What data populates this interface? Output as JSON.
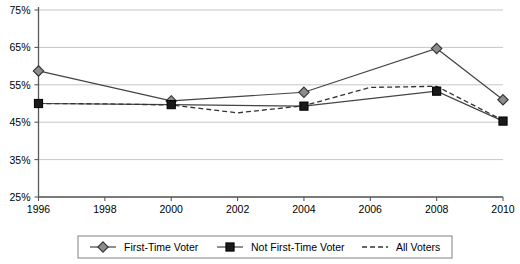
{
  "chart_data": {
    "type": "line",
    "title": "",
    "subtitle": "",
    "xlabel": "",
    "ylabel": "",
    "x": [
      1996,
      1998,
      2000,
      2002,
      2004,
      2006,
      2008,
      2010
    ],
    "xtick_labels": [
      "1996",
      "1998",
      "2000",
      "2002",
      "2004",
      "2006",
      "2008",
      "2010"
    ],
    "ytick_labels": [
      "25%",
      "35%",
      "45%",
      "55%",
      "65%",
      "75%"
    ],
    "ytick_values": [
      25,
      35,
      45,
      55,
      65,
      75
    ],
    "ylim": [
      25,
      75
    ],
    "xlim": [
      1996,
      2010
    ],
    "grid": true,
    "legend_position": "bottom",
    "series": [
      {
        "name": "First-Time Voter",
        "marker": "diamond",
        "linestyle": "solid",
        "color": "#8c8c8c",
        "x": [
          1996,
          2000,
          2004,
          2008,
          2010
        ],
        "values": [
          58.7,
          50.7,
          53.0,
          64.7,
          51.0
        ]
      },
      {
        "name": "Not First-Time Voter",
        "marker": "square",
        "linestyle": "solid",
        "color": "#1a1a1a",
        "x": [
          1996,
          2000,
          2004,
          2008,
          2010
        ],
        "values": [
          50.0,
          49.7,
          49.3,
          53.3,
          45.3
        ]
      },
      {
        "name": "All Voters",
        "marker": "none",
        "linestyle": "dashed",
        "color": "#333333",
        "x": [
          1996,
          1998,
          2000,
          2002,
          2004,
          2006,
          2008,
          2010
        ],
        "values": [
          50.0,
          49.9,
          49.6,
          47.5,
          49.4,
          54.3,
          54.6,
          45.5
        ]
      }
    ]
  },
  "axis": {
    "y_ticks": [
      {
        "label": "75%",
        "value": 75
      },
      {
        "label": "65%",
        "value": 65
      },
      {
        "label": "55%",
        "value": 55
      },
      {
        "label": "45%",
        "value": 45
      },
      {
        "label": "35%",
        "value": 35
      },
      {
        "label": "25%",
        "value": 25
      }
    ],
    "x_ticks": [
      {
        "label": "1996",
        "value": 1996
      },
      {
        "label": "1998",
        "value": 1998
      },
      {
        "label": "2000",
        "value": 2000
      },
      {
        "label": "2002",
        "value": 2002
      },
      {
        "label": "2004",
        "value": 2004
      },
      {
        "label": "2006",
        "value": 2006
      },
      {
        "label": "2008",
        "value": 2008
      },
      {
        "label": "2010",
        "value": 2010
      }
    ]
  },
  "legend": {
    "entries": [
      {
        "label": "First-Time Voter",
        "marker": "diamond",
        "linestyle": "solid"
      },
      {
        "label": "Not First-Time Voter",
        "marker": "square",
        "linestyle": "solid"
      },
      {
        "label": "All Voters",
        "marker": "none",
        "linestyle": "dashed"
      }
    ]
  },
  "colors": {
    "gridline": "#b7b7b7",
    "axis": "#595959",
    "diamond_fill": "#8c8c8c",
    "square_fill": "#1a1a1a",
    "line": "#444444",
    "dashed": "#333333",
    "legend_border": "#808080",
    "background": "#ffffff"
  }
}
